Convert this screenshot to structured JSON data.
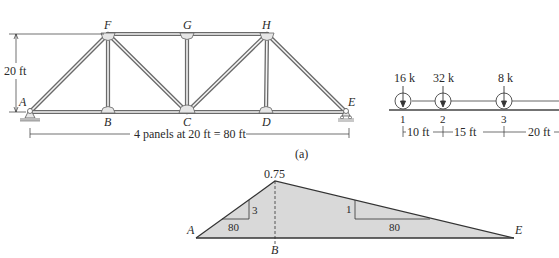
{
  "truss": {
    "nodes": {
      "A": {
        "label": "A"
      },
      "B": {
        "label": "B"
      },
      "C": {
        "label": "C"
      },
      "D": {
        "label": "D"
      },
      "E": {
        "label": "E"
      },
      "F": {
        "label": "F"
      },
      "G": {
        "label": "G"
      },
      "H": {
        "label": "H"
      }
    },
    "height_label": "20 ft",
    "span_label": "4 panels at 20 ft = 80 ft",
    "caption": "(a)"
  },
  "load_train": {
    "loads": [
      {
        "label": "16 k",
        "wheel": "1"
      },
      {
        "label": "32 k",
        "wheel": "2"
      },
      {
        "label": "8 k",
        "wheel": "3"
      }
    ],
    "spacings": [
      "10 ft",
      "15 ft",
      "20 ft"
    ]
  },
  "influence_line": {
    "peak_value": "0.75",
    "left_slope": {
      "rise": "3",
      "run": "80"
    },
    "right_slope": {
      "rise": "1",
      "run": "80"
    },
    "labels": {
      "left": "A",
      "peak": "B",
      "right": "E"
    },
    "fill_color": "#d9d9d9"
  }
}
